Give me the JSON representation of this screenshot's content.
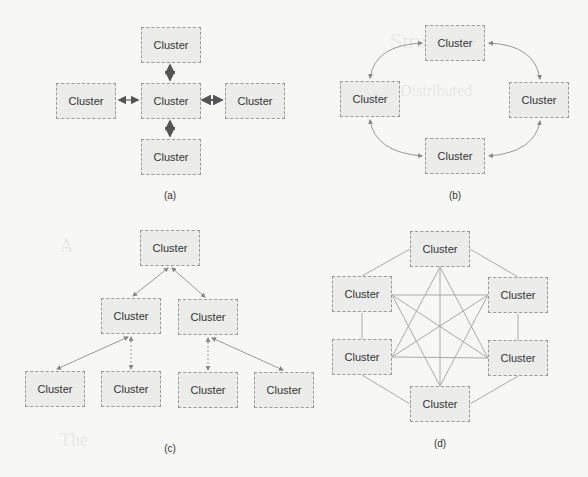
{
  "diagrams": [
    {
      "id": "a",
      "caption": "(a)",
      "topology": "star",
      "nodes": [
        {
          "label": "Cluster",
          "x": 141,
          "y": 27
        },
        {
          "label": "Cluster",
          "x": 56,
          "y": 83
        },
        {
          "label": "Cluster",
          "x": 141,
          "y": 83
        },
        {
          "label": "Cluster",
          "x": 225,
          "y": 83
        },
        {
          "label": "Cluster",
          "x": 141,
          "y": 139
        }
      ]
    },
    {
      "id": "b",
      "caption": "(b)",
      "topology": "ring",
      "nodes": [
        {
          "label": "Cluster",
          "x": 425,
          "y": 25
        },
        {
          "label": "Cluster",
          "x": 340,
          "y": 81
        },
        {
          "label": "Cluster",
          "x": 509,
          "y": 82
        },
        {
          "label": "Cluster",
          "x": 425,
          "y": 138
        }
      ]
    },
    {
      "id": "c",
      "caption": "(c)",
      "topology": "tree",
      "nodes": [
        {
          "label": "Cluster",
          "x": 140,
          "y": 230
        },
        {
          "label": "Cluster",
          "x": 101,
          "y": 298
        },
        {
          "label": "Cluster",
          "x": 178,
          "y": 299
        },
        {
          "label": "Cluster",
          "x": 25,
          "y": 371
        },
        {
          "label": "Cluster",
          "x": 101,
          "y": 371
        },
        {
          "label": "Cluster",
          "x": 178,
          "y": 372
        },
        {
          "label": "Cluster",
          "x": 254,
          "y": 372
        }
      ]
    },
    {
      "id": "d",
      "caption": "(d)",
      "topology": "full-mesh",
      "nodes": [
        {
          "label": "Cluster",
          "x": 410,
          "y": 231
        },
        {
          "label": "Cluster",
          "x": 332,
          "y": 276
        },
        {
          "label": "Cluster",
          "x": 488,
          "y": 277
        },
        {
          "label": "Cluster",
          "x": 332,
          "y": 339
        },
        {
          "label": "Cluster",
          "x": 488,
          "y": 340
        },
        {
          "label": "Cluster",
          "x": 410,
          "y": 386
        }
      ]
    }
  ]
}
